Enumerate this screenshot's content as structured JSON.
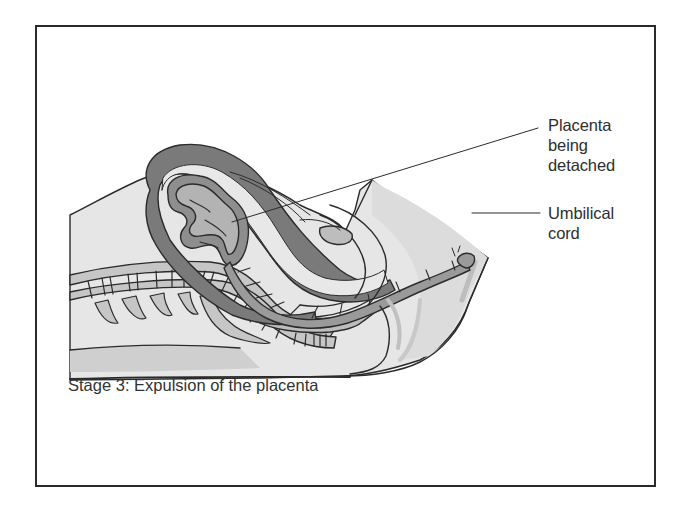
{
  "figure": {
    "caption": "Stage 3: Expulsion of the placenta",
    "labels": [
      {
        "id": "placenta",
        "lines": [
          "Placenta",
          "being",
          "detached"
        ]
      },
      {
        "id": "umbilical-cord",
        "lines": [
          "Umbilical",
          "cord"
        ]
      }
    ]
  },
  "colors": {
    "frame": "#2a2a2a",
    "outline": "#2b2b2b",
    "skin_light": "#e6e6e6",
    "tissue_mid": "#c4c4c4",
    "uterus_wall": "#7a7a7a",
    "placenta_dark": "#8e8e8e",
    "placenta_light": "#b3b3b3"
  }
}
